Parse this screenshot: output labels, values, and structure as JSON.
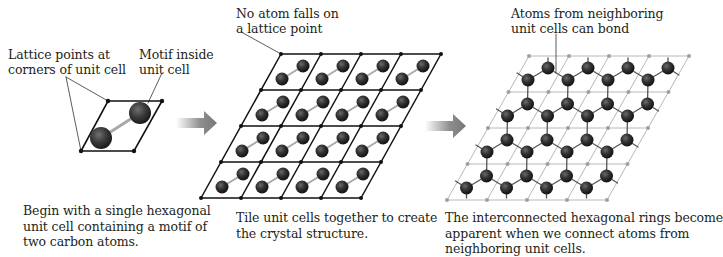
{
  "panels": [
    {
      "id": "single-cell",
      "labels": [
        {
          "text": "Lattice points at\ncorners of unit cell",
          "x": 8,
          "y": 47
        },
        {
          "text": "Motif inside\nunit cell",
          "x": 139,
          "y": 47
        }
      ],
      "caption": {
        "text": "Begin with a single hexagonal\nunit cell containing a motif of\ntwo carbon atoms.",
        "x": 23,
        "y": 203
      }
    },
    {
      "id": "tiled-cells",
      "labels": [
        {
          "text": "No atom falls on\na lattice point",
          "x": 236,
          "y": 6
        }
      ],
      "caption": {
        "text": "Tile unit cells together to create\nthe crystal structure.",
        "x": 236,
        "y": 210
      }
    },
    {
      "id": "bonded-rings",
      "labels": [
        {
          "text": "Atoms from neighboring\nunit cells can bond",
          "x": 511,
          "y": 6
        }
      ],
      "caption": {
        "text": "The interconnected hexagonal rings become\napparent when we connect atoms from\nneighboring unit cells.",
        "x": 445,
        "y": 210
      }
    }
  ],
  "geometry": {
    "single_cell": {
      "corners": [
        [
          108,
          101
        ],
        [
          162,
          101
        ],
        [
          134,
          151
        ],
        [
          81,
          151
        ]
      ],
      "atoms": [
        [
          140,
          113
        ],
        [
          101,
          138
        ]
      ],
      "atom_radius": 11,
      "callouts": [
        [
          [
            66,
            77
          ],
          [
            108,
            101
          ]
        ],
        [
          [
            66,
            77
          ],
          [
            81,
            151
          ]
        ],
        [
          [
            162,
            73
          ],
          [
            148,
            103
          ]
        ]
      ]
    },
    "tiled": {
      "origin": [
        281,
        54
      ],
      "rows": 4,
      "cols": 4,
      "cell_w": 40,
      "row_h": 36,
      "row_shift": -20,
      "upper": [
        22,
        12
      ],
      "lower": [
        1,
        25
      ],
      "atom_radius": 6.5,
      "callout": [
        [
          243,
          33
        ],
        [
          281,
          54
        ]
      ]
    },
    "bonded": {
      "origin": [
        529,
        56
      ],
      "rows": 4,
      "cols": 4,
      "cell_w": 40,
      "row_h": 36,
      "row_shift": -20.5,
      "upper": [
        19,
        12
      ],
      "lower": [
        -1,
        24
      ],
      "atom_radius": 6.5,
      "callout": [
        [
          556,
          34
        ],
        [
          556,
          73
        ]
      ]
    },
    "arrows": [
      {
        "x": 176,
        "y": 123,
        "len": 41
      },
      {
        "x": 425,
        "y": 126,
        "len": 41
      }
    ]
  },
  "colors": {
    "line": "#111111",
    "lattice_light": "#b8b8b8",
    "atom_dark": "#1a1a1a",
    "atom_mid": "#4a4a4a",
    "bond": "#a8a8a8",
    "arrow": "#7a7a7a",
    "text": "#231f20"
  }
}
